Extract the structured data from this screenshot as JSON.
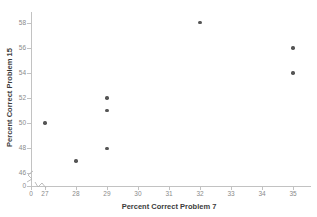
{
  "chart_data": {
    "type": "scatter",
    "title": "",
    "xlabel": "Percent Correct Problem 7",
    "ylabel": "Percent Correct Problem 15",
    "grid": false,
    "legend": null,
    "xlim": [
      26.5,
      35.5
    ],
    "ylim": [
      45,
      59
    ],
    "x_ticks": [
      "0",
      "27",
      "28",
      "29",
      "30",
      "31",
      "32",
      "33",
      "34",
      "35"
    ],
    "y_ticks": [
      "0",
      "46",
      "48",
      "50",
      "52",
      "54",
      "56",
      "58"
    ],
    "axis_break": {
      "x": true,
      "y": true,
      "symbol": "zigzag"
    },
    "marker_color": "#555555",
    "axis_color": "#c2c2c2",
    "points": [
      {
        "x": 27,
        "y": 50
      },
      {
        "x": 28,
        "y": 47
      },
      {
        "x": 29,
        "y": 52
      },
      {
        "x": 29,
        "y": 51
      },
      {
        "x": 29,
        "y": 48
      },
      {
        "x": 32,
        "y": 58
      },
      {
        "x": 35,
        "y": 56
      },
      {
        "x": 35,
        "y": 54
      }
    ]
  }
}
